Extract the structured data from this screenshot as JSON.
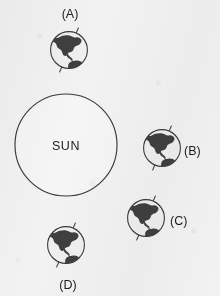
{
  "figure": {
    "background_color": "#f3f3f3",
    "stroke_color": "#3a3a3a",
    "land_color": "#3f3f3f",
    "ocean_color": "#f0f0f0",
    "width": 220,
    "height": 296
  },
  "sun": {
    "label": "SUN",
    "cx": 66,
    "cy": 145,
    "r": 51
  },
  "earths": [
    {
      "id": "A",
      "label": "(A)",
      "cx": 69,
      "cy": 50,
      "r": 19,
      "axis_tilt_deg": 23,
      "label_x": 70,
      "label_y": 18,
      "label_anchor": "middle"
    },
    {
      "id": "B",
      "label": "(B)",
      "cx": 162,
      "cy": 148,
      "r": 19,
      "axis_tilt_deg": 23,
      "label_x": 184,
      "label_y": 155,
      "label_anchor": "start"
    },
    {
      "id": "C",
      "label": "(C)",
      "cx": 146,
      "cy": 218,
      "r": 19,
      "axis_tilt_deg": 23,
      "label_x": 170,
      "label_y": 225,
      "label_anchor": "start"
    },
    {
      "id": "D",
      "label": "(D)",
      "cx": 66,
      "cy": 245,
      "r": 19,
      "axis_tilt_deg": 23,
      "label_x": 68,
      "label_y": 289,
      "label_anchor": "middle"
    }
  ]
}
